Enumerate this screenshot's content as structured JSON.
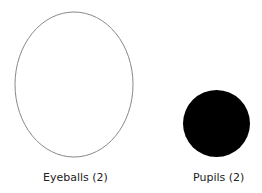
{
  "parts": [
    {
      "name": "eyeball",
      "label": "Eyeballs (2)",
      "shape": "ellipse",
      "fill": "#ffffff",
      "stroke": "#888888"
    },
    {
      "name": "pupil",
      "label": "Pupils (2)",
      "shape": "circle",
      "fill": "#000000",
      "stroke": "none"
    }
  ]
}
